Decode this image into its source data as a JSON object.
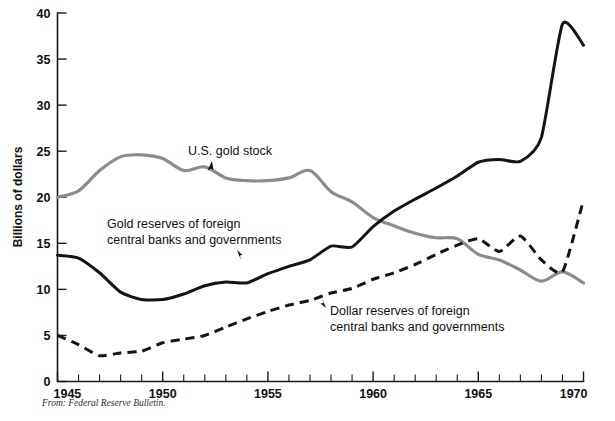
{
  "figure": {
    "source_note": "From: Federal Reserve Bulletin.",
    "ylabel": "Billions of dollars"
  },
  "annotations": {
    "gold_stock": {
      "label": "U.S. gold stock"
    },
    "gold_reserves": {
      "line1": "Gold reserves of foreign",
      "line2": "central banks and governments"
    },
    "dollar_reserves": {
      "line1": "Dollar reserves of foreign",
      "line2": "central banks and governments"
    }
  },
  "axes": {
    "y_ticks": [
      "0",
      "5",
      "10",
      "15",
      "20",
      "25",
      "30",
      "35",
      "40"
    ],
    "x_ticks": [
      "1945",
      "1950",
      "1955",
      "1960",
      "1965",
      "1970"
    ]
  },
  "colors": {
    "gold_stock": "#8c8c8c",
    "gold_reserves": "#141414",
    "dollar_reserves": "#141414",
    "axis": "#1a1a1a",
    "background": "#ffffff"
  },
  "chart_data": {
    "type": "line",
    "title": "",
    "subtitle": "",
    "xlabel": "",
    "ylabel": "Billions of dollars",
    "xlim": [
      1945,
      1970
    ],
    "ylim": [
      0,
      40
    ],
    "grid": false,
    "legend": "inline-annotations",
    "x": [
      1945,
      1946,
      1947,
      1948,
      1949,
      1950,
      1951,
      1952,
      1953,
      1954,
      1955,
      1956,
      1957,
      1958,
      1959,
      1960,
      1961,
      1962,
      1963,
      1964,
      1965,
      1966,
      1967,
      1968,
      1969,
      1970
    ],
    "series": [
      {
        "name": "U.S. gold stock",
        "color": "#8c8c8c",
        "style": "solid",
        "values": [
          20.0,
          20.7,
          22.9,
          24.4,
          24.6,
          24.2,
          22.9,
          23.3,
          22.1,
          21.8,
          21.8,
          22.1,
          22.9,
          20.6,
          19.5,
          17.8,
          16.9,
          16.1,
          15.6,
          15.5,
          13.8,
          13.2,
          12.1,
          10.9,
          11.9,
          10.7
        ]
      },
      {
        "name": "Gold reserves of foreign central banks and governments",
        "color": "#141414",
        "style": "solid",
        "values": [
          13.7,
          13.4,
          11.8,
          9.7,
          8.9,
          8.9,
          9.5,
          10.4,
          10.8,
          10.7,
          11.7,
          12.5,
          13.2,
          14.7,
          14.6,
          16.8,
          18.5,
          19.8,
          21.0,
          22.3,
          23.8,
          24.1,
          23.9,
          26.5,
          38.8,
          36.5
        ]
      },
      {
        "name": "Dollar reserves of foreign central banks and governments",
        "color": "#141414",
        "style": "dashed",
        "values": [
          5.0,
          4.0,
          2.8,
          3.1,
          3.3,
          4.2,
          4.6,
          5.0,
          5.9,
          6.8,
          7.6,
          8.3,
          8.8,
          9.6,
          10.1,
          11.1,
          11.8,
          12.7,
          13.8,
          14.8,
          15.5,
          14.1,
          15.8,
          13.2,
          11.9,
          19.7
        ]
      }
    ]
  }
}
